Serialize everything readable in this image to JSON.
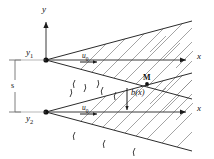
{
  "figure": {
    "background_color": "#ffffff",
    "line_color": "#2b2b2b",
    "hatch_color": "#8d8d8d"
  },
  "labels": {
    "y_axis": "y",
    "x_axis_upper": "x",
    "x_axis_lower": "x",
    "origin_upper": "y",
    "origin_upper_sub": "1",
    "origin_lower": "y",
    "origin_lower_sub": "2",
    "spacing": "s",
    "velocity_upper": "u",
    "velocity_upper_sub": "0",
    "velocity_lower": "u",
    "velocity_lower_sub": "0",
    "merge_point": "M",
    "width_function": "b(x)"
  },
  "geometry": {
    "upper_vertex": {
      "x": 46,
      "y": 60
    },
    "lower_vertex": {
      "x": 46,
      "y": 112
    },
    "merge_point": {
      "x": 147,
      "y": 81
    },
    "y_axis_x": 46,
    "y_axis_top": 18,
    "x_axis_right": 192,
    "dim_line_x": 15,
    "spacing_value_px": 52,
    "wedge_half_angle_deg": 15
  }
}
